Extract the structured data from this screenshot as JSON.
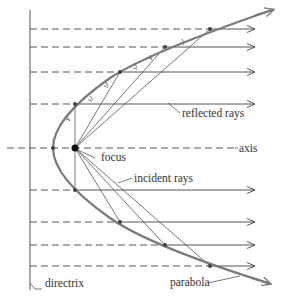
{
  "diagram": {
    "labels": {
      "reflected_rays": "reflected rays",
      "axis": "axis",
      "focus": "focus",
      "incident_rays": "incident rays",
      "directrix": "directrix",
      "parabola": "parabola"
    },
    "colors": {
      "parabola": "#7a7a7a",
      "lines": "#555555",
      "focus": "#111111",
      "text": "#333333"
    },
    "geometry": {
      "directrix_x": 30,
      "axis_y": 148,
      "focus": [
        75,
        148
      ],
      "vertex": [
        53,
        148
      ],
      "ray_end_x": 255,
      "upper_ray_points": [
        [
          75,
          104
        ],
        [
          120,
          72
        ],
        [
          165,
          47
        ],
        [
          210,
          29
        ]
      ],
      "lower_ray_points": [
        [
          75,
          190
        ],
        [
          120,
          222
        ],
        [
          165,
          245
        ],
        [
          210,
          266
        ]
      ]
    }
  }
}
